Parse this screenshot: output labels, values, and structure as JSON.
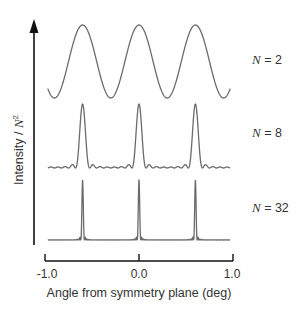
{
  "chart_data": {
    "type": "line",
    "title": "",
    "xlabel": "Angle from symmetry plane (deg)",
    "ylabel": "Intensity / N^2",
    "ylabel_parts": {
      "main": "Intensity",
      "sep": " / ",
      "var": "N",
      "exp": "2"
    },
    "xlim": [
      -1.0,
      1.0
    ],
    "x_ticks": [
      -1.0,
      0.0,
      1.0
    ],
    "x_tick_labels": [
      "-1.0",
      "0.0",
      "1.0"
    ],
    "grid": false,
    "legend_position": "right (inline labels per trace)",
    "peak_positions_deg": [
      -0.6,
      0.0,
      0.6
    ],
    "peak_period_deg": 0.6,
    "x_range_plotted": [
      -0.97,
      0.97
    ],
    "series": [
      {
        "name": "N = 2",
        "var": "N",
        "value": "2",
        "N": 2,
        "normalized_peak": 1.0,
        "description": "sinusoidal cos^2 fringes, maxima at -0.6, 0.0, 0.6"
      },
      {
        "name": "N = 8",
        "var": "N",
        "value": "8",
        "N": 8,
        "normalized_peak": 1.0,
        "description": "sharp principal maxima with small secondary ripples"
      },
      {
        "name": "N = 32",
        "var": "N",
        "value": "32",
        "N": 32,
        "normalized_peak": 1.0,
        "description": "very narrow spike-like principal maxima, flat baseline"
      }
    ],
    "formula": "I/N^2 = sin^2(N*pi*x/d) / (N^2 sin^2(pi*x/d)), d = 0.6 deg"
  },
  "colors": {
    "curve": "#6b6b6b",
    "axis": "#111111",
    "text": "#333333"
  }
}
